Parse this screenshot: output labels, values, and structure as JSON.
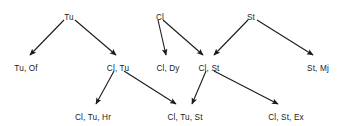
{
  "diagram": {
    "type": "directed-acyclic-graph",
    "title": "",
    "background_color": "#ffffff",
    "text_color": "#1b1b1b",
    "edge_color": "#1b1b1b",
    "nodes": [
      {
        "id": "tu",
        "label": "Tu",
        "x": 69,
        "y": 13
      },
      {
        "id": "cl",
        "label": "Cl",
        "x": 160,
        "y": 13
      },
      {
        "id": "st",
        "label": "St",
        "x": 251,
        "y": 13
      },
      {
        "id": "tu_of",
        "label": "Tu, Of",
        "x": 26,
        "y": 64
      },
      {
        "id": "cl_tu",
        "label": "Cl, Tu",
        "x": 118,
        "y": 64
      },
      {
        "id": "cl_dy",
        "label": "Cl, Dy",
        "x": 168,
        "y": 64
      },
      {
        "id": "cl_st",
        "label": "Cl, St",
        "x": 209,
        "y": 64
      },
      {
        "id": "st_mj",
        "label": "St, Mj",
        "x": 318,
        "y": 64
      },
      {
        "id": "cl_tu_hr",
        "label": "Cl, Tu, Hr",
        "x": 93,
        "y": 113
      },
      {
        "id": "cl_tu_st",
        "label": "Cl, Tu, St",
        "x": 185,
        "y": 113
      },
      {
        "id": "cl_st_ex",
        "label": "Cl, St, Ex",
        "x": 286,
        "y": 113
      }
    ],
    "edges": [
      {
        "id": "e1",
        "from": "tu",
        "to": "tu_of",
        "x1": 64,
        "y1": 20,
        "x2": 30,
        "y2": 55
      },
      {
        "id": "e2",
        "from": "tu",
        "to": "cl_tu",
        "x1": 75,
        "y1": 20,
        "x2": 116,
        "y2": 55
      },
      {
        "id": "e3",
        "from": "cl",
        "to": "cl_dy",
        "x1": 158,
        "y1": 20,
        "x2": 166,
        "y2": 55
      },
      {
        "id": "e4",
        "from": "cl",
        "to": "cl_st",
        "x1": 163,
        "y1": 20,
        "x2": 203,
        "y2": 55
      },
      {
        "id": "e5",
        "from": "st",
        "to": "cl_st",
        "x1": 248,
        "y1": 20,
        "x2": 214,
        "y2": 55
      },
      {
        "id": "e6",
        "from": "st",
        "to": "st_mj",
        "x1": 257,
        "y1": 20,
        "x2": 313,
        "y2": 55
      },
      {
        "id": "e7",
        "from": "cl_tu",
        "to": "cl_tu_hr",
        "x1": 114,
        "y1": 71,
        "x2": 96,
        "y2": 104
      },
      {
        "id": "e8",
        "from": "cl_tu",
        "to": "cl_tu_st",
        "x1": 124,
        "y1": 71,
        "x2": 176,
        "y2": 104
      },
      {
        "id": "e9",
        "from": "cl_st",
        "to": "cl_tu_st",
        "x1": 206,
        "y1": 71,
        "x2": 192,
        "y2": 104
      },
      {
        "id": "e10",
        "from": "cl_st",
        "to": "cl_st_ex",
        "x1": 214,
        "y1": 71,
        "x2": 278,
        "y2": 104
      }
    ]
  }
}
